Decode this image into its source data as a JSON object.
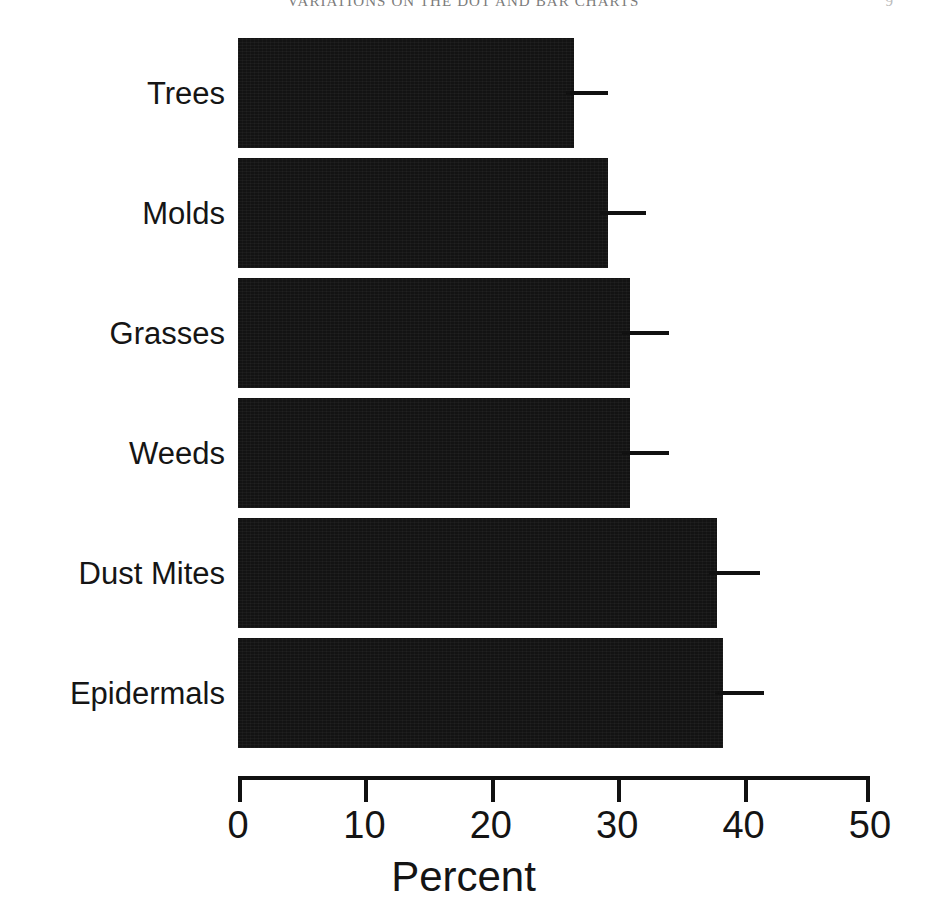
{
  "running_head": {
    "title": "VARIATIONS ON THE DOT AND BAR CHARTS",
    "page": "9"
  },
  "chart_data": {
    "type": "bar",
    "orientation": "horizontal",
    "title": "",
    "subtitle": "",
    "xlabel": "Percent",
    "ylabel": "",
    "categories": [
      "Trees",
      "Molds",
      "Grasses",
      "Weeds",
      "Dust Mites",
      "Epidermals"
    ],
    "values": [
      26.6,
      29.3,
      31.0,
      31.0,
      37.9,
      38.4
    ],
    "error_upper": [
      29.3,
      32.3,
      34.1,
      34.1,
      41.3,
      41.6
    ],
    "series": [
      {
        "name": "Percent",
        "values": [
          26.6,
          29.3,
          31.0,
          31.0,
          37.9,
          38.4
        ]
      }
    ],
    "xticks": [
      0,
      10,
      20,
      30,
      40,
      50
    ],
    "xtick_labels": [
      "0",
      "10",
      "20",
      "30",
      "40",
      "50"
    ],
    "xlim": [
      0,
      50
    ],
    "grid": false,
    "legend": false,
    "legend_position": "none",
    "bar_color": "#131313",
    "axis_color": "#111111",
    "error_bar_style": "single-sided horizontal whisker, no cap"
  }
}
